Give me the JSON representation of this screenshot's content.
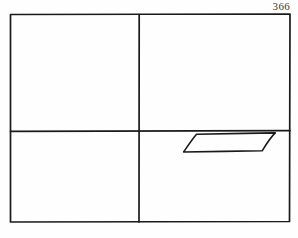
{
  "page": {
    "number": "366",
    "background_color": "#fefefe",
    "ink_color": "#1a1a1a"
  },
  "figure": {
    "name": "four-quadrant-rectangle-with-parallelogram",
    "outer_rectangle": {
      "left": 10,
      "top": 14,
      "right": 290,
      "bottom": 222,
      "stroke_width": 1.7
    },
    "vertical_divider": {
      "x": 139,
      "y_start": 14,
      "y_end": 222,
      "stroke_width": 1.7
    },
    "horizontal_divider": {
      "y": 131,
      "x_start": 10,
      "x_end": 290,
      "stroke_width": 1.7
    },
    "parallelogram": {
      "points": "196,134 275,133 262,151 183,152",
      "stroke_width": 1.6,
      "quadrant": "lower-right"
    }
  }
}
